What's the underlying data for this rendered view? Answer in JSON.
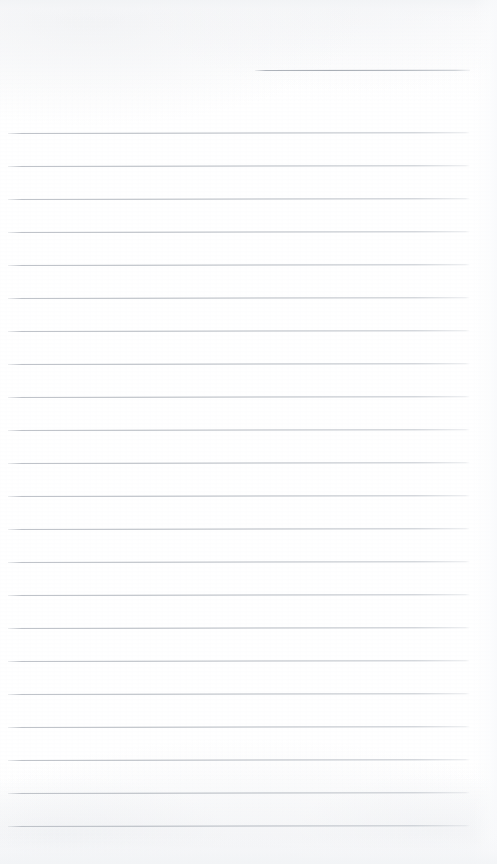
{
  "document": {
    "kind": "scanned-lined-notepaper",
    "title": "Blank Lined Notepaper",
    "orientation": "portrait",
    "page_width_px": 497,
    "page_height_px": 864,
    "has_text_content": false,
    "has_handwriting": false,
    "paper_color": "#fdfdfd",
    "rule_color": "#b4b9c1",
    "rule_thickness_px": 1
  },
  "header_rule": {
    "name": "header-rule",
    "description": "short rule at top right, typically for a date or name",
    "x_start": 255,
    "x_end": 470,
    "y": 70,
    "length_px": 215,
    "content": ""
  },
  "body_rules": {
    "count": 22,
    "x_start": 8,
    "x_end": 470,
    "length_px": 462,
    "first_y": 133,
    "spacing_px": 32.5,
    "lines": [
      {
        "index": 1,
        "y": 133,
        "content": ""
      },
      {
        "index": 2,
        "y": 166,
        "content": ""
      },
      {
        "index": 3,
        "y": 199,
        "content": ""
      },
      {
        "index": 4,
        "y": 232,
        "content": ""
      },
      {
        "index": 5,
        "y": 265,
        "content": ""
      },
      {
        "index": 6,
        "y": 298,
        "content": ""
      },
      {
        "index": 7,
        "y": 331,
        "content": ""
      },
      {
        "index": 8,
        "y": 364,
        "content": ""
      },
      {
        "index": 9,
        "y": 397,
        "content": ""
      },
      {
        "index": 10,
        "y": 430,
        "content": ""
      },
      {
        "index": 11,
        "y": 463,
        "content": ""
      },
      {
        "index": 12,
        "y": 496,
        "content": ""
      },
      {
        "index": 13,
        "y": 529,
        "content": ""
      },
      {
        "index": 14,
        "y": 562,
        "content": ""
      },
      {
        "index": 15,
        "y": 595,
        "content": ""
      },
      {
        "index": 16,
        "y": 628,
        "content": ""
      },
      {
        "index": 17,
        "y": 661,
        "content": ""
      },
      {
        "index": 18,
        "y": 694,
        "content": ""
      },
      {
        "index": 19,
        "y": 727,
        "content": ""
      },
      {
        "index": 20,
        "y": 760,
        "content": ""
      },
      {
        "index": 21,
        "y": 793,
        "content": ""
      },
      {
        "index": 22,
        "y": 826,
        "content": ""
      }
    ]
  }
}
